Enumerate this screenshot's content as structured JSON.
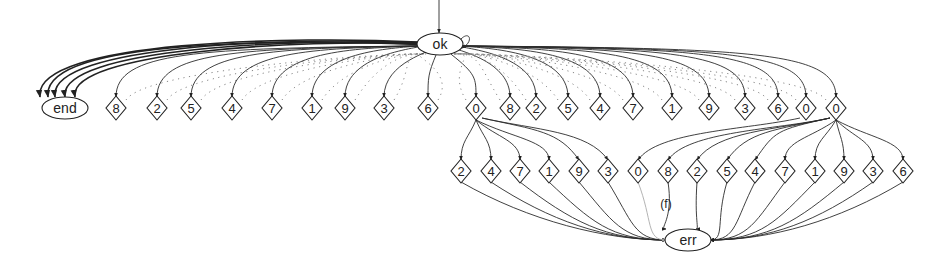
{
  "diagram": {
    "type": "state-machine",
    "nodes": {
      "ok": {
        "label": "ok",
        "shape": "ellipse",
        "x": 440,
        "y": 44
      },
      "end": {
        "label": "end",
        "shape": "ellipse",
        "x": 65,
        "y": 108
      },
      "err": {
        "label": "err",
        "shape": "ellipse",
        "x": 688,
        "y": 240
      }
    },
    "top_row": [
      {
        "label": "8",
        "x": 116
      },
      {
        "label": "2",
        "x": 157
      },
      {
        "label": "5",
        "x": 191
      },
      {
        "label": "4",
        "x": 232
      },
      {
        "label": "7",
        "x": 272
      },
      {
        "label": "1",
        "x": 312
      },
      {
        "label": "9",
        "x": 345
      },
      {
        "label": "3",
        "x": 384
      },
      {
        "label": "6",
        "x": 428
      },
      {
        "label": "0",
        "x": 476
      },
      {
        "label": "8",
        "x": 510
      },
      {
        "label": "2",
        "x": 536
      },
      {
        "label": "5",
        "x": 568
      },
      {
        "label": "4",
        "x": 600
      },
      {
        "label": "7",
        "x": 633
      },
      {
        "label": "1",
        "x": 672
      },
      {
        "label": "9",
        "x": 709
      },
      {
        "label": "3",
        "x": 745
      },
      {
        "label": "6",
        "x": 778
      },
      {
        "label": "0",
        "x": 806
      },
      {
        "label": "0",
        "x": 836
      }
    ],
    "top_row_y": 108,
    "bottom_row": [
      {
        "label": "2",
        "x": 461,
        "parent": 9
      },
      {
        "label": "4",
        "x": 491,
        "parent": 9
      },
      {
        "label": "7",
        "x": 520,
        "parent": 9
      },
      {
        "label": "1",
        "x": 549,
        "parent": 9
      },
      {
        "label": "9",
        "x": 579,
        "parent": 9
      },
      {
        "label": "3",
        "x": 608,
        "parent": 9
      },
      {
        "label": "0",
        "x": 638,
        "parent": 19
      },
      {
        "label": "8",
        "x": 668,
        "parent": 20
      },
      {
        "label": "2",
        "x": 697,
        "parent": 20
      },
      {
        "label": "5",
        "x": 727,
        "parent": 20
      },
      {
        "label": "4",
        "x": 755,
        "parent": 20
      },
      {
        "label": "7",
        "x": 785,
        "parent": 20
      },
      {
        "label": "1",
        "x": 815,
        "parent": 20
      },
      {
        "label": "9",
        "x": 844,
        "parent": 20
      },
      {
        "label": "3",
        "x": 873,
        "parent": 20
      },
      {
        "label": "6",
        "x": 903,
        "parent": 20
      }
    ],
    "bottom_row_y": 171,
    "edge_labels": [
      {
        "text": "(f)",
        "x": 666,
        "y": 208
      }
    ]
  }
}
